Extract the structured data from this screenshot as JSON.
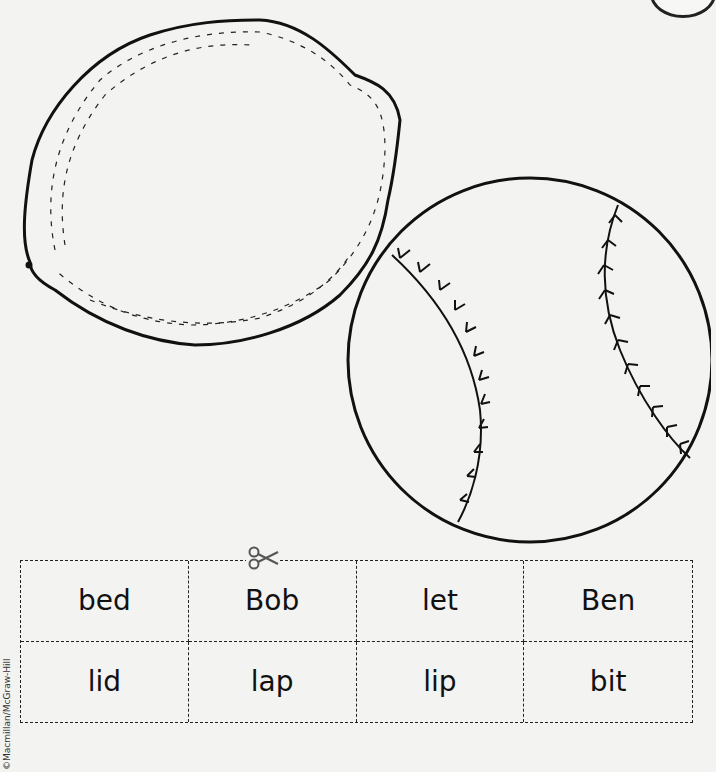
{
  "pictures": [
    {
      "name": "lemon"
    },
    {
      "name": "ball"
    }
  ],
  "word_cards": {
    "rows": [
      [
        "bed",
        "Bob",
        "let",
        "Ben"
      ],
      [
        "lid",
        "lap",
        "lip",
        "bit"
      ]
    ]
  },
  "icons": {
    "scissors": "scissors-icon"
  },
  "footer": {
    "copyright": "©Macmillan/McGraw-Hill"
  }
}
